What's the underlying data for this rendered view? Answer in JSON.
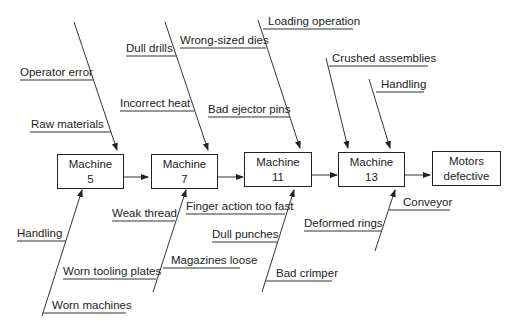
{
  "diagram": {
    "type": "cause-and-effect (fishbone)",
    "process_steps": [
      {
        "line1": "Machine",
        "line2": "5"
      },
      {
        "line1": "Machine",
        "line2": "7"
      },
      {
        "line1": "Machine",
        "line2": "11"
      },
      {
        "line1": "Machine",
        "line2": "13"
      }
    ],
    "effect": {
      "line1": "Motors",
      "line2": "defective"
    },
    "causes": {
      "machine5_top": [
        "Operator error",
        "Raw materials"
      ],
      "machine5_bottom": [
        "Handling",
        "Worn machines"
      ],
      "machine7_top": [
        "Dull drills",
        "Incorrect heat"
      ],
      "machine7_bottom": [
        "Weak thread",
        "Worn tooling plates",
        "Magazines loose"
      ],
      "machine11_top": [
        "Wrong-sized dies",
        "Bad ejector pins"
      ],
      "machine11_bottom": [
        "Finger action too fast",
        "Dull punches",
        "Bad crimper"
      ],
      "machine13_top": [
        "Loading operation",
        "Crushed assemblies",
        "Handling"
      ],
      "machine13_bottom": [
        "Conveyor",
        "Deformed rings"
      ]
    }
  }
}
